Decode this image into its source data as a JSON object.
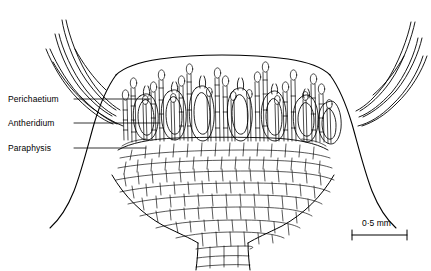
{
  "figure": {
    "type": "biological-line-drawing",
    "background_color": "#ffffff",
    "line_color": "#000000"
  },
  "labels": [
    {
      "id": "perichaetium",
      "text": "Perichaetium",
      "leader": "horizontal-line-to-structure"
    },
    {
      "id": "antheridium",
      "text": "Antheridium",
      "leader": "horizontal-line-to-structure"
    },
    {
      "id": "paraphysis",
      "text": "Paraphysis",
      "leader": "horizontal-line-to-structure"
    }
  ],
  "scale_bar": {
    "text": "0·5 mm",
    "length_px": 55,
    "has_end_ticks": true
  }
}
